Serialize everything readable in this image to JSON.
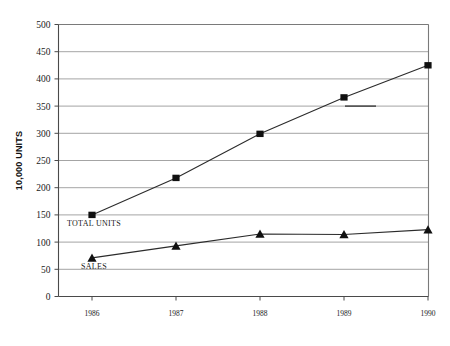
{
  "chart_data": {
    "type": "line",
    "title": "",
    "xlabel": "",
    "ylabel": "10,000 UNITS",
    "categories": [
      "1986",
      "1987",
      "1988",
      "1989",
      "1990"
    ],
    "ylim": [
      0,
      500
    ],
    "ytick_labels": [
      "0",
      "50",
      "100",
      "150",
      "200",
      "250",
      "300",
      "350",
      "400",
      "450",
      "500"
    ],
    "ytick_values": [
      0,
      50,
      100,
      150,
      200,
      250,
      300,
      350,
      400,
      450,
      500
    ],
    "grid": true,
    "legend_position": "inline-labels",
    "series": [
      {
        "name": "TOTAL UNITS",
        "marker": "square",
        "values": [
          150,
          218,
          299,
          366,
          425
        ]
      },
      {
        "name": "SALES",
        "marker": "triangle",
        "values": [
          71,
          93,
          115,
          114,
          123
        ]
      }
    ],
    "annotations": [
      {
        "text": "TOTAL UNITS",
        "series": "TOTAL UNITS",
        "anchor_category": "1986"
      },
      {
        "text": "SALES",
        "series": "SALES",
        "anchor_category": "1986"
      }
    ]
  },
  "colors": {
    "line": "#2b2b2b",
    "marker": "#101010",
    "grid": "#8d8d8d",
    "frame": "#7a7a7a",
    "background": "#ffffff"
  }
}
